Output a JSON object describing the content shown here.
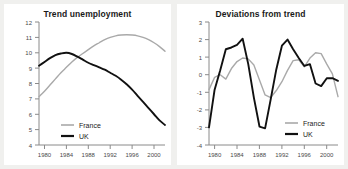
{
  "figure": {
    "background_color": "#f0f0ee",
    "panel_color": "#ffffff"
  },
  "colors": {
    "france": "#a9a9a9",
    "uk": "#111111",
    "axis": "#8a8a8a",
    "text": "#1a1a1a"
  },
  "legend": {
    "france_label": "France",
    "uk_label": "UK"
  },
  "chart_data": [
    {
      "type": "line",
      "title": "Trend unemployment",
      "xlabel": "",
      "ylabel": "",
      "xlim": [
        1979,
        2002
      ],
      "ylim": [
        4,
        12
      ],
      "xticks": [
        1980,
        1984,
        1988,
        1992,
        1996,
        2000
      ],
      "xticklabels": [
        "1980",
        "1984",
        "1988",
        "1992",
        "1996",
        "2000"
      ],
      "yticks": [
        4,
        5,
        6,
        7,
        8,
        9,
        10,
        11,
        12
      ],
      "yticklabels": [
        "4",
        "5",
        "6",
        "7",
        "8",
        "9",
        "10",
        "11",
        "12"
      ],
      "grid": false,
      "legend_position": "lower-left-inside",
      "x": [
        1979,
        1980,
        1981,
        1982,
        1983,
        1984,
        1985,
        1986,
        1987,
        1988,
        1989,
        1990,
        1991,
        1992,
        1993,
        1994,
        1995,
        1996,
        1997,
        1998,
        1999,
        2000,
        2001,
        2002
      ],
      "series": [
        {
          "name": "France",
          "values": [
            7.15,
            7.5,
            7.9,
            8.3,
            8.7,
            9.05,
            9.4,
            9.7,
            9.95,
            10.2,
            10.45,
            10.65,
            10.85,
            11.0,
            11.1,
            11.15,
            11.17,
            11.15,
            11.1,
            11.0,
            10.85,
            10.65,
            10.4,
            10.1,
            9.8
          ]
        },
        {
          "name": "UK",
          "values": [
            9.15,
            9.4,
            9.65,
            9.85,
            9.95,
            10.0,
            9.92,
            9.75,
            9.55,
            9.35,
            9.2,
            9.05,
            8.9,
            8.7,
            8.5,
            8.25,
            7.95,
            7.6,
            7.2,
            6.8,
            6.4,
            6.0,
            5.6,
            5.3,
            5.05
          ]
        }
      ]
    },
    {
      "type": "line",
      "title": "Deviations from trend",
      "xlabel": "",
      "ylabel": "",
      "xlim": [
        1979,
        2002
      ],
      "ylim": [
        -4,
        3
      ],
      "xticks": [
        1980,
        1984,
        1988,
        1992,
        1996,
        2000
      ],
      "xticklabels": [
        "1980",
        "1984",
        "1988",
        "1992",
        "1996",
        "2000"
      ],
      "yticks": [
        -4,
        -3,
        -2,
        -1,
        0,
        1,
        2,
        3
      ],
      "yticklabels": [
        "-4",
        "-3",
        "-2",
        "-1",
        "0",
        "1",
        "2",
        "3"
      ],
      "grid": false,
      "legend_position": "lower-right-inside",
      "x": [
        1979,
        1980,
        1981,
        1982,
        1983,
        1984,
        1985,
        1986,
        1987,
        1988,
        1989,
        1990,
        1991,
        1992,
        1993,
        1994,
        1995,
        1996,
        1997,
        1998,
        1999,
        2000,
        2001,
        2002
      ],
      "series": [
        {
          "name": "France",
          "values": [
            -0.85,
            -0.15,
            0.0,
            -0.25,
            0.35,
            0.75,
            0.95,
            0.9,
            0.55,
            -0.3,
            -1.15,
            -1.3,
            -0.9,
            -0.4,
            0.25,
            0.8,
            0.85,
            0.45,
            0.95,
            1.25,
            1.2,
            0.6,
            0.05,
            -1.25,
            -0.3
          ]
        },
        {
          "name": "UK",
          "values": [
            -3.0,
            -0.85,
            0.25,
            1.45,
            1.55,
            1.7,
            2.05,
            0.6,
            -1.3,
            -2.95,
            -3.05,
            -1.4,
            0.3,
            1.65,
            2.0,
            1.45,
            0.95,
            0.5,
            0.6,
            -0.5,
            -0.65,
            -0.2,
            -0.2,
            -0.35,
            0.35
          ]
        }
      ]
    }
  ]
}
